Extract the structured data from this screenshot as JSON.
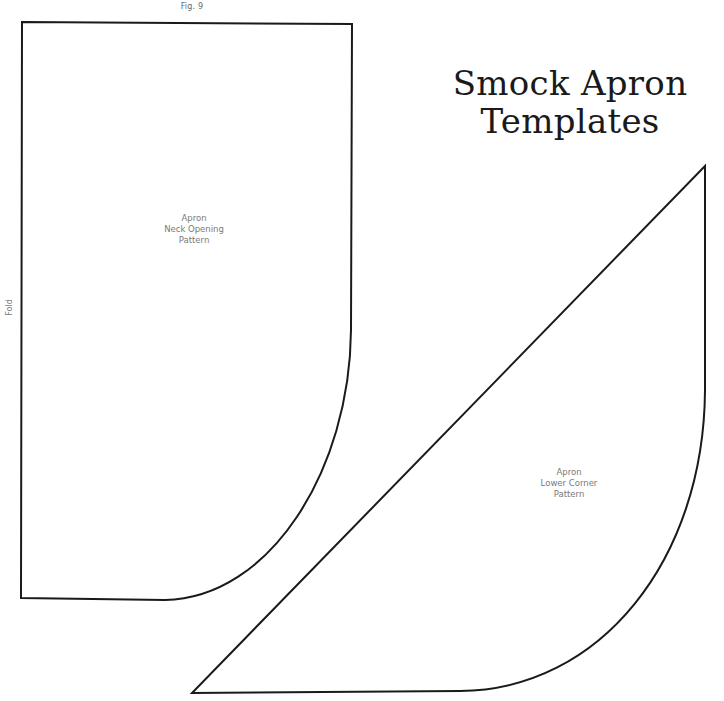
{
  "figure": {
    "label": "Fig. 9"
  },
  "title": {
    "line1": "Smock Apron",
    "line2": "Templates"
  },
  "patterns": [
    {
      "id": "neck-opening",
      "lines": [
        "Apron",
        "Neck Opening",
        "Pattern"
      ],
      "edge_label": "Fold"
    },
    {
      "id": "lower-corner",
      "lines": [
        "Apron",
        "Lower Corner",
        "Pattern"
      ]
    }
  ],
  "colors": {
    "outline": "#1a1a1a",
    "label_text": "#7a7a7a",
    "title_text": "#1a1a1a",
    "background": "#ffffff"
  }
}
